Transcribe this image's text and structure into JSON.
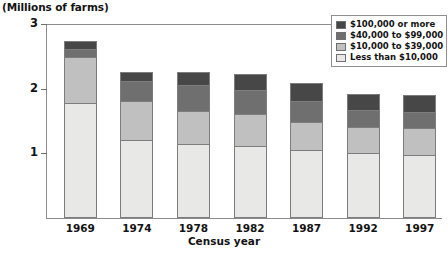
{
  "figure": {
    "y_unit_caption": "(Millions of farms)",
    "x_axis_title": "Census year",
    "footnote": ""
  },
  "legend": {
    "items": [
      {
        "label": "$100,000 or more",
        "color": "#474747"
      },
      {
        "label": "$40,000 to $99,000",
        "color": "#6f6f6f"
      },
      {
        "label": "$10,000 to $39,000",
        "color": "#c0c0c0"
      },
      {
        "label": "Less than $10,000",
        "color": "#e8e8e6"
      }
    ]
  },
  "chart_data": {
    "type": "bar",
    "stacked": true,
    "title": "",
    "subtitle": "",
    "xlabel": "Census year",
    "ylabel": "(Millions of farms)",
    "ylim": [
      0,
      3
    ],
    "yticks": [
      1,
      2,
      3
    ],
    "ytick_labels": [
      "1",
      "2",
      "3"
    ],
    "grid": false,
    "legend_position": "top-right",
    "categories": [
      "1969",
      "1974",
      "1978",
      "1982",
      "1987",
      "1992",
      "1997"
    ],
    "series": [
      {
        "name": "Less than $10,000",
        "color": "#e8e8e6",
        "values": [
          1.77,
          1.19,
          1.13,
          1.1,
          1.03,
          0.99,
          0.96
        ]
      },
      {
        "name": "$10,000 to $39,000",
        "color": "#c0c0c0",
        "values": [
          0.71,
          0.62,
          0.52,
          0.5,
          0.45,
          0.41,
          0.43
        ]
      },
      {
        "name": "$40,000 to $99,000",
        "color": "#6f6f6f",
        "values": [
          0.13,
          0.3,
          0.4,
          0.37,
          0.33,
          0.26,
          0.24
        ]
      },
      {
        "name": "$100,000 or more",
        "color": "#474747",
        "values": [
          0.12,
          0.15,
          0.21,
          0.25,
          0.28,
          0.26,
          0.28
        ]
      }
    ],
    "totals": [
      2.73,
      2.26,
      2.26,
      2.22,
      2.09,
      1.92,
      1.91
    ]
  }
}
